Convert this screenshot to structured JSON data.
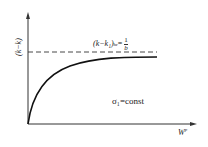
{
  "diagram": {
    "y_axis_label": "(k−k)",
    "x_axis_label": "W",
    "x_axis_superscript": "p",
    "asymptote_label_left": "(k−k₁)",
    "asymptote_label_sub": "hr",
    "asymptote_label_eq": "=",
    "asymptote_fraction_num": "1",
    "asymptote_fraction_den": "b",
    "condition_label": "σ₁=const",
    "colors": {
      "line": "#222222",
      "background": "#ffffff"
    }
  }
}
